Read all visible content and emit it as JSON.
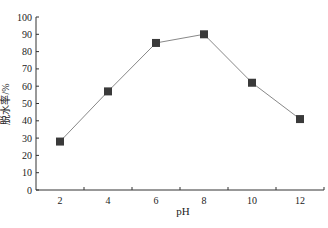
{
  "chart_data": {
    "type": "line",
    "title": "",
    "xlabel": "pH",
    "ylabel": "脱水率/%",
    "categories": [
      "2",
      "4",
      "6",
      "8",
      "10",
      "12"
    ],
    "x": [
      2,
      4,
      6,
      8,
      10,
      12
    ],
    "series": [
      {
        "name": "脱水率",
        "values": [
          28,
          57,
          85,
          90,
          62,
          41
        ],
        "marker": "square",
        "color": "#3a3a3a"
      }
    ],
    "ylim": [
      0,
      100
    ],
    "yticks": [
      0,
      10,
      20,
      30,
      40,
      50,
      60,
      70,
      80,
      90,
      100
    ],
    "xlim": [
      1,
      13
    ],
    "grid": false,
    "legend": "none"
  },
  "colors": {
    "line": "#888888",
    "marker": "#3a3a3a",
    "axis": "#333333"
  }
}
